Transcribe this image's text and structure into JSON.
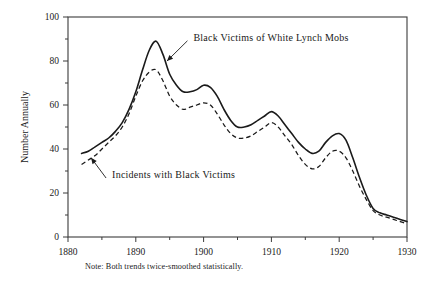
{
  "chart_data": {
    "type": "line",
    "title": "",
    "xlabel": "",
    "ylabel": "Number Annually",
    "xlim": [
      1880,
      1930
    ],
    "ylim": [
      0,
      100
    ],
    "grid": false,
    "legend_position": "inline-annotations",
    "note": "Note: Both trends twice-smoothed statistically.",
    "x_ticks": [
      1880,
      1890,
      1900,
      1910,
      1920,
      1930
    ],
    "x_minor_ticks": [
      1885,
      1895,
      1905,
      1915,
      1925
    ],
    "y_ticks": [
      0,
      20,
      40,
      60,
      80,
      100
    ],
    "y_minor_ticks": [
      10,
      30,
      50,
      70,
      90
    ],
    "x_tick_labels": [
      "1880",
      "1890",
      "1900",
      "1910",
      "1920",
      "1930"
    ],
    "y_tick_labels": [
      "0",
      "20",
      "40",
      "60",
      "80",
      "100"
    ],
    "x": [
      1882,
      1883,
      1884,
      1885,
      1886,
      1887,
      1888,
      1889,
      1890,
      1891,
      1892,
      1893,
      1894,
      1895,
      1896,
      1897,
      1898,
      1899,
      1900,
      1901,
      1902,
      1903,
      1904,
      1905,
      1906,
      1907,
      1908,
      1909,
      1910,
      1911,
      1912,
      1913,
      1914,
      1915,
      1916,
      1917,
      1918,
      1919,
      1920,
      1921,
      1922,
      1923,
      1924,
      1925,
      1926,
      1927,
      1928,
      1929,
      1930
    ],
    "series": [
      {
        "name": "Black Victims of White Lynch Mobs",
        "style": "solid",
        "color": "#1a1a1a",
        "values": [
          38,
          39,
          41,
          43,
          45,
          48,
          52,
          58,
          66,
          76,
          85,
          89,
          83,
          74,
          69,
          66,
          66,
          67,
          69,
          68,
          64,
          58,
          53,
          50,
          50,
          51,
          53,
          55,
          57,
          55,
          51,
          47,
          43,
          40,
          38,
          39,
          43,
          46,
          47,
          44,
          36,
          27,
          19,
          13,
          11,
          10,
          9,
          8,
          7
        ]
      },
      {
        "name": "Incidents with Black Victims",
        "style": "dashed",
        "color": "#1a1a1a",
        "values": [
          33,
          35,
          37,
          40,
          43,
          46,
          50,
          56,
          64,
          71,
          75,
          76,
          71,
          64,
          60,
          58,
          59,
          60,
          61,
          60,
          56,
          51,
          47,
          45,
          45,
          46,
          48,
          50,
          52,
          50,
          46,
          42,
          37,
          33,
          31,
          32,
          36,
          39,
          39,
          36,
          30,
          23,
          17,
          12,
          10,
          9,
          8,
          7,
          6
        ]
      }
    ],
    "annotations": [
      {
        "label": "Black Victims of White Lynch Mobs",
        "target_x": 1894.6,
        "target_y": 80,
        "text_x": 1898.5,
        "text_y": 91
      },
      {
        "label": "Incidents with Black Victims",
        "target_x": 1883.4,
        "target_y": 36,
        "text_x": 1886.5,
        "text_y": 25
      }
    ]
  }
}
